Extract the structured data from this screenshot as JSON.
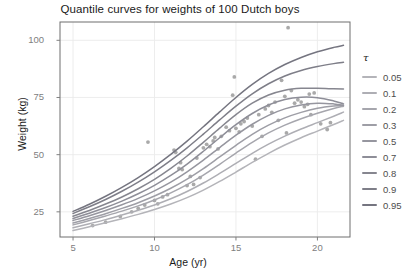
{
  "chart_data": {
    "type": "line",
    "title": "Quantile curves for weights of 100 Dutch boys",
    "xlabel": "Age (yr)",
    "ylabel": "Weight (kg)",
    "xlim": [
      4.2,
      22.0
    ],
    "ylim": [
      14.0,
      108.0
    ],
    "xticks": [
      5,
      10,
      15,
      20
    ],
    "xtick_labels": [
      "5",
      "10",
      "15",
      "20"
    ],
    "yticks": [
      25,
      50,
      75,
      100
    ],
    "ytick_labels": [
      "25",
      "50",
      "75",
      "100"
    ],
    "grid": true,
    "legend_position": "right",
    "legend_title": "τ",
    "point_color": "#9a9a9a",
    "line_color_low": "#a9a9ae",
    "line_color_high": "#7a7a80",
    "panel_border_color": "#6e6e6e",
    "grid_color": "#ebebeb",
    "series": [
      {
        "name": "0.05",
        "color": "#b4b4b9",
        "x": [
          5.0,
          6.0,
          7.0,
          8.0,
          9.0,
          10.0,
          11.0,
          12.0,
          13.0,
          14.0,
          15.0,
          16.0,
          17.0,
          18.0,
          19.0,
          20.0,
          21.0,
          21.6
        ],
        "values": [
          16.8,
          18.5,
          20.2,
          22.0,
          23.9,
          26.0,
          28.4,
          31.2,
          34.5,
          38.3,
          42.4,
          46.6,
          50.6,
          54.2,
          57.4,
          60.3,
          63.2,
          65.0
        ]
      },
      {
        "name": "0.1",
        "color": "#aeaeb4",
        "x": [
          5.0,
          6.0,
          7.0,
          8.0,
          9.0,
          10.0,
          11.0,
          12.0,
          13.0,
          14.0,
          15.0,
          16.0,
          17.0,
          18.0,
          19.0,
          20.0,
          21.0,
          21.6
        ],
        "values": [
          18.0,
          19.8,
          21.6,
          23.6,
          25.7,
          28.0,
          30.7,
          33.9,
          37.6,
          41.8,
          46.2,
          50.6,
          54.6,
          58.1,
          61.2,
          64.0,
          66.8,
          68.6
        ]
      },
      {
        "name": "0.2",
        "color": "#a6a6ad",
        "x": [
          5.0,
          6.0,
          7.0,
          8.0,
          9.0,
          10.0,
          11.0,
          12.0,
          13.0,
          14.0,
          15.0,
          16.0,
          17.0,
          18.0,
          19.0,
          20.0,
          21.0,
          21.6
        ],
        "values": [
          19.3,
          21.2,
          23.2,
          25.3,
          27.6,
          30.2,
          33.3,
          36.9,
          41.1,
          45.8,
          50.7,
          55.4,
          59.5,
          62.9,
          65.7,
          68.1,
          70.2,
          71.2
        ]
      },
      {
        "name": "0.3",
        "color": "#9e9ea6",
        "x": [
          5.0,
          6.0,
          7.0,
          8.0,
          9.0,
          10.0,
          11.0,
          12.0,
          13.0,
          14.0,
          15.0,
          16.0,
          17.0,
          18.0,
          19.0,
          20.0,
          21.0,
          21.6
        ],
        "values": [
          20.1,
          22.1,
          24.2,
          26.5,
          29.0,
          31.9,
          35.3,
          39.3,
          43.9,
          49.0,
          54.1,
          58.9,
          62.9,
          66.1,
          68.5,
          70.3,
          71.3,
          71.5
        ]
      },
      {
        "name": "0.5",
        "color": "#96969f",
        "x": [
          5.0,
          6.0,
          7.0,
          8.0,
          9.0,
          10.0,
          11.0,
          12.0,
          13.0,
          14.0,
          15.0,
          16.0,
          17.0,
          18.0,
          19.0,
          20.0,
          21.0,
          21.6
        ],
        "values": [
          21.2,
          23.3,
          25.6,
          28.1,
          30.9,
          34.2,
          38.0,
          42.5,
          47.6,
          53.1,
          58.5,
          63.3,
          67.2,
          70.0,
          71.7,
          72.5,
          72.2,
          71.6
        ]
      },
      {
        "name": "0.7",
        "color": "#8e8e98",
        "x": [
          5.0,
          6.0,
          7.0,
          8.0,
          9.0,
          10.0,
          11.0,
          12.0,
          13.0,
          14.0,
          15.0,
          16.0,
          17.0,
          18.0,
          19.0,
          20.0,
          21.0,
          21.6
        ],
        "values": [
          22.1,
          24.4,
          26.9,
          29.7,
          32.9,
          36.6,
          40.9,
          45.9,
          51.5,
          57.4,
          63.1,
          68.0,
          71.7,
          74.1,
          75.1,
          74.9,
          73.5,
          72.2
        ]
      },
      {
        "name": "0.8",
        "color": "#86868f",
        "x": [
          5.0,
          6.0,
          7.0,
          8.0,
          9.0,
          10.0,
          11.0,
          12.0,
          13.0,
          14.0,
          15.0,
          16.0,
          17.0,
          18.0,
          19.0,
          20.0,
          21.0,
          21.6
        ],
        "values": [
          23.1,
          25.6,
          28.4,
          31.5,
          35.1,
          39.2,
          44.0,
          49.4,
          55.4,
          61.6,
          67.5,
          72.5,
          76.1,
          78.2,
          79.0,
          79.0,
          78.8,
          78.7
        ]
      },
      {
        "name": "0.9",
        "color": "#7e7e88",
        "x": [
          5.0,
          6.0,
          7.0,
          8.0,
          9.0,
          10.0,
          11.0,
          12.0,
          13.0,
          14.0,
          15.0,
          16.0,
          17.0,
          18.0,
          19.0,
          20.0,
          21.0,
          21.6
        ],
        "values": [
          24.3,
          27.2,
          30.4,
          34.0,
          38.0,
          42.5,
          47.5,
          53.0,
          59.0,
          65.2,
          71.2,
          76.6,
          81.0,
          84.4,
          86.8,
          88.5,
          89.8,
          90.4
        ]
      },
      {
        "name": "0.95",
        "color": "#757580",
        "x": [
          5.0,
          6.0,
          7.0,
          8.0,
          9.0,
          10.0,
          11.0,
          12.0,
          13.0,
          14.0,
          15.0,
          16.0,
          17.0,
          18.0,
          19.0,
          20.0,
          21.0,
          21.6
        ],
        "values": [
          25.2,
          28.3,
          31.8,
          35.7,
          40.0,
          44.8,
          50.1,
          55.9,
          62.2,
          68.7,
          75.0,
          80.7,
          85.5,
          89.4,
          92.5,
          95.0,
          96.9,
          97.8
        ]
      }
    ],
    "scatter": {
      "label": "observed weights",
      "color": "#9a9a9a",
      "points": [
        [
          9.6,
          55.5
        ],
        [
          10.2,
          28.5
        ],
        [
          11.2,
          52.0
        ],
        [
          11.3,
          51.0
        ],
        [
          11.5,
          44.0
        ],
        [
          11.6,
          46.5
        ],
        [
          11.7,
          43.5
        ],
        [
          12.0,
          36.5
        ],
        [
          12.2,
          40.5
        ],
        [
          12.6,
          48.5
        ],
        [
          13.0,
          53.0
        ],
        [
          13.2,
          54.5
        ],
        [
          13.4,
          53.5
        ],
        [
          13.6,
          56.0
        ],
        [
          13.7,
          57.5
        ],
        [
          14.1,
          58.0
        ],
        [
          14.4,
          62.0
        ],
        [
          14.6,
          60.5
        ],
        [
          14.8,
          76.0
        ],
        [
          14.9,
          84.0
        ],
        [
          15.0,
          61.5
        ],
        [
          15.2,
          60.0
        ],
        [
          15.3,
          63.5
        ],
        [
          15.5,
          64.5
        ],
        [
          15.7,
          66.0
        ],
        [
          16.0,
          62.5
        ],
        [
          16.2,
          48.0
        ],
        [
          16.4,
          67.5
        ],
        [
          16.8,
          70.0
        ],
        [
          17.0,
          71.5
        ],
        [
          17.2,
          68.5
        ],
        [
          17.4,
          73.0
        ],
        [
          17.6,
          65.0
        ],
        [
          17.8,
          82.5
        ],
        [
          18.0,
          75.5
        ],
        [
          18.2,
          105.5
        ],
        [
          18.4,
          78.0
        ],
        [
          18.6,
          72.5
        ],
        [
          18.8,
          74.0
        ],
        [
          19.0,
          73.0
        ],
        [
          19.2,
          71.0
        ],
        [
          19.4,
          72.0
        ],
        [
          19.5,
          76.5
        ],
        [
          19.6,
          67.5
        ],
        [
          19.8,
          77.0
        ],
        [
          20.2,
          63.5
        ],
        [
          20.6,
          61.0
        ],
        [
          20.8,
          64.0
        ],
        [
          6.2,
          19.0
        ],
        [
          7.0,
          20.5
        ],
        [
          7.9,
          23.0
        ],
        [
          8.6,
          25.0
        ],
        [
          9.0,
          26.5
        ],
        [
          9.4,
          28.0
        ],
        [
          10.0,
          30.0
        ],
        [
          10.5,
          31.5
        ],
        [
          10.8,
          32.5
        ],
        [
          12.4,
          37.0
        ],
        [
          12.8,
          40.0
        ],
        [
          13.9,
          52.5
        ],
        [
          16.6,
          58.0
        ],
        [
          18.1,
          59.5
        ]
      ]
    }
  },
  "legend": {
    "title": "τ",
    "items": [
      {
        "label": "0.05"
      },
      {
        "label": "0.1"
      },
      {
        "label": "0.2"
      },
      {
        "label": "0.3"
      },
      {
        "label": "0.5"
      },
      {
        "label": "0.7"
      },
      {
        "label": "0.8"
      },
      {
        "label": "0.9"
      },
      {
        "label": "0.95"
      }
    ]
  }
}
